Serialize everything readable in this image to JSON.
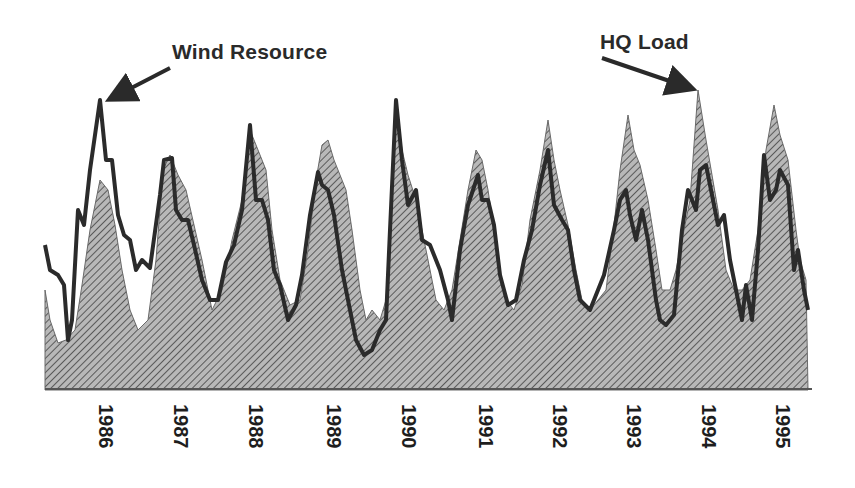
{
  "chart_data": {
    "type": "area",
    "title": "",
    "xlabel": "",
    "ylabel": "",
    "x_tick_labels": [
      "1986",
      "1987",
      "1988",
      "1989",
      "1990",
      "1991",
      "1992",
      "1993",
      "1994",
      "1995"
    ],
    "annotations": [
      {
        "text": "Wind Resource",
        "points_to": "Wind Resource line peak, early 1986"
      },
      {
        "text": "HQ Load",
        "points_to": "HQ Load area peak, early 1994"
      }
    ],
    "grid": false,
    "legend": "none (series identified by arrow annotations)",
    "series": [
      {
        "name": "HQ Load",
        "style": "hatched gray filled area",
        "points": [
          [
            45,
            290
          ],
          [
            50,
            320
          ],
          [
            58,
            343
          ],
          [
            66,
            340
          ],
          [
            75,
            330
          ],
          [
            82,
            285
          ],
          [
            90,
            230
          ],
          [
            100,
            180
          ],
          [
            108,
            190
          ],
          [
            115,
            225
          ],
          [
            122,
            270
          ],
          [
            130,
            310
          ],
          [
            138,
            330
          ],
          [
            148,
            320
          ],
          [
            156,
            260
          ],
          [
            163,
            170
          ],
          [
            170,
            155
          ],
          [
            178,
            175
          ],
          [
            186,
            190
          ],
          [
            194,
            225
          ],
          [
            202,
            260
          ],
          [
            212,
            310
          ],
          [
            222,
            290
          ],
          [
            232,
            240
          ],
          [
            242,
            200
          ],
          [
            250,
            130
          ],
          [
            258,
            150
          ],
          [
            266,
            170
          ],
          [
            272,
            230
          ],
          [
            280,
            280
          ],
          [
            290,
            305
          ],
          [
            300,
            300
          ],
          [
            308,
            250
          ],
          [
            316,
            180
          ],
          [
            322,
            145
          ],
          [
            328,
            140
          ],
          [
            334,
            160
          ],
          [
            340,
            175
          ],
          [
            346,
            190
          ],
          [
            352,
            230
          ],
          [
            360,
            290
          ],
          [
            366,
            320
          ],
          [
            372,
            310
          ],
          [
            380,
            320
          ],
          [
            386,
            300
          ],
          [
            390,
            240
          ],
          [
            396,
            100
          ],
          [
            402,
            150
          ],
          [
            408,
            175
          ],
          [
            416,
            200
          ],
          [
            424,
            240
          ],
          [
            430,
            270
          ],
          [
            436,
            300
          ],
          [
            444,
            310
          ],
          [
            452,
            290
          ],
          [
            460,
            240
          ],
          [
            468,
            190
          ],
          [
            476,
            150
          ],
          [
            482,
            160
          ],
          [
            488,
            190
          ],
          [
            494,
            230
          ],
          [
            500,
            280
          ],
          [
            506,
            300
          ],
          [
            514,
            310
          ],
          [
            522,
            285
          ],
          [
            530,
            220
          ],
          [
            540,
            170
          ],
          [
            548,
            120
          ],
          [
            554,
            160
          ],
          [
            560,
            190
          ],
          [
            568,
            225
          ],
          [
            576,
            270
          ],
          [
            582,
            300
          ],
          [
            590,
            310
          ],
          [
            598,
            300
          ],
          [
            606,
            290
          ],
          [
            614,
            225
          ],
          [
            620,
            170
          ],
          [
            628,
            115
          ],
          [
            634,
            150
          ],
          [
            640,
            165
          ],
          [
            648,
            200
          ],
          [
            656,
            250
          ],
          [
            662,
            290
          ],
          [
            670,
            290
          ],
          [
            676,
            270
          ],
          [
            682,
            240
          ],
          [
            690,
            200
          ],
          [
            698,
            90
          ],
          [
            706,
            140
          ],
          [
            712,
            175
          ],
          [
            718,
            210
          ],
          [
            726,
            270
          ],
          [
            734,
            290
          ],
          [
            742,
            290
          ],
          [
            750,
            280
          ],
          [
            758,
            230
          ],
          [
            766,
            150
          ],
          [
            774,
            105
          ],
          [
            780,
            135
          ],
          [
            788,
            160
          ],
          [
            796,
            230
          ],
          [
            800,
            260
          ],
          [
            806,
            280
          ],
          [
            808,
            390
          ],
          [
            45,
            390
          ]
        ]
      },
      {
        "name": "Wind Resource",
        "style": "thick dark line",
        "points": [
          [
            45,
            245
          ],
          [
            50,
            270
          ],
          [
            58,
            275
          ],
          [
            64,
            285
          ],
          [
            68,
            340
          ],
          [
            72,
            320
          ],
          [
            78,
            210
          ],
          [
            84,
            225
          ],
          [
            90,
            170
          ],
          [
            100,
            100
          ],
          [
            106,
            160
          ],
          [
            112,
            160
          ],
          [
            118,
            215
          ],
          [
            124,
            235
          ],
          [
            130,
            240
          ],
          [
            136,
            270
          ],
          [
            142,
            260
          ],
          [
            150,
            268
          ],
          [
            160,
            195
          ],
          [
            164,
            160
          ],
          [
            172,
            158
          ],
          [
            176,
            210
          ],
          [
            182,
            220
          ],
          [
            188,
            220
          ],
          [
            194,
            245
          ],
          [
            202,
            280
          ],
          [
            210,
            300
          ],
          [
            218,
            300
          ],
          [
            226,
            262
          ],
          [
            234,
            245
          ],
          [
            242,
            210
          ],
          [
            250,
            125
          ],
          [
            256,
            200
          ],
          [
            262,
            200
          ],
          [
            268,
            220
          ],
          [
            274,
            270
          ],
          [
            280,
            285
          ],
          [
            288,
            320
          ],
          [
            296,
            305
          ],
          [
            302,
            275
          ],
          [
            310,
            215
          ],
          [
            318,
            172
          ],
          [
            322,
            185
          ],
          [
            328,
            190
          ],
          [
            334,
            215
          ],
          [
            342,
            270
          ],
          [
            350,
            310
          ],
          [
            356,
            340
          ],
          [
            364,
            355
          ],
          [
            372,
            350
          ],
          [
            380,
            330
          ],
          [
            386,
            320
          ],
          [
            390,
            230
          ],
          [
            396,
            100
          ],
          [
            402,
            160
          ],
          [
            408,
            205
          ],
          [
            416,
            190
          ],
          [
            422,
            240
          ],
          [
            430,
            245
          ],
          [
            440,
            270
          ],
          [
            448,
            300
          ],
          [
            452,
            320
          ],
          [
            460,
            250
          ],
          [
            468,
            205
          ],
          [
            478,
            175
          ],
          [
            482,
            200
          ],
          [
            488,
            200
          ],
          [
            494,
            225
          ],
          [
            500,
            275
          ],
          [
            508,
            305
          ],
          [
            516,
            300
          ],
          [
            524,
            260
          ],
          [
            532,
            230
          ],
          [
            540,
            185
          ],
          [
            548,
            150
          ],
          [
            554,
            205
          ],
          [
            562,
            220
          ],
          [
            568,
            230
          ],
          [
            574,
            270
          ],
          [
            580,
            300
          ],
          [
            590,
            310
          ],
          [
            598,
            290
          ],
          [
            604,
            275
          ],
          [
            614,
            230
          ],
          [
            620,
            200
          ],
          [
            626,
            190
          ],
          [
            630,
            215
          ],
          [
            636,
            240
          ],
          [
            642,
            210
          ],
          [
            648,
            240
          ],
          [
            656,
            300
          ],
          [
            660,
            320
          ],
          [
            666,
            325
          ],
          [
            674,
            315
          ],
          [
            682,
            230
          ],
          [
            688,
            190
          ],
          [
            696,
            210
          ],
          [
            700,
            170
          ],
          [
            706,
            165
          ],
          [
            712,
            195
          ],
          [
            718,
            225
          ],
          [
            724,
            215
          ],
          [
            730,
            260
          ],
          [
            736,
            290
          ],
          [
            742,
            320
          ],
          [
            746,
            285
          ],
          [
            752,
            320
          ],
          [
            758,
            250
          ],
          [
            764,
            155
          ],
          [
            770,
            200
          ],
          [
            776,
            190
          ],
          [
            780,
            170
          ],
          [
            788,
            185
          ],
          [
            794,
            270
          ],
          [
            798,
            250
          ],
          [
            804,
            290
          ],
          [
            808,
            310
          ]
        ]
      }
    ],
    "x_range_px": [
      45,
      808
    ],
    "baseline_px": 388
  }
}
